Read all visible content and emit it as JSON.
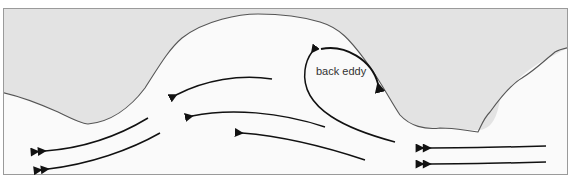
{
  "diagram": {
    "type": "river-flow-back-eddy",
    "label": "back eddy",
    "colors": {
      "land": "#e3e3e3",
      "water": "#fafafa",
      "coastline": "#555555",
      "arrow": "#111111",
      "frame": "#9a9a9a"
    },
    "flow_arrows": [
      {
        "id": "inflow-top",
        "heads": 2
      },
      {
        "id": "inflow-bottom",
        "heads": 2
      },
      {
        "id": "main-1",
        "heads": 1
      },
      {
        "id": "main-2",
        "heads": 1
      },
      {
        "id": "main-3",
        "heads": 1
      },
      {
        "id": "outflow-top",
        "heads": 2
      },
      {
        "id": "outflow-bottom",
        "heads": 2
      },
      {
        "id": "eddy-loop",
        "heads": 1
      },
      {
        "id": "eddy-arc",
        "heads": 1
      }
    ]
  }
}
